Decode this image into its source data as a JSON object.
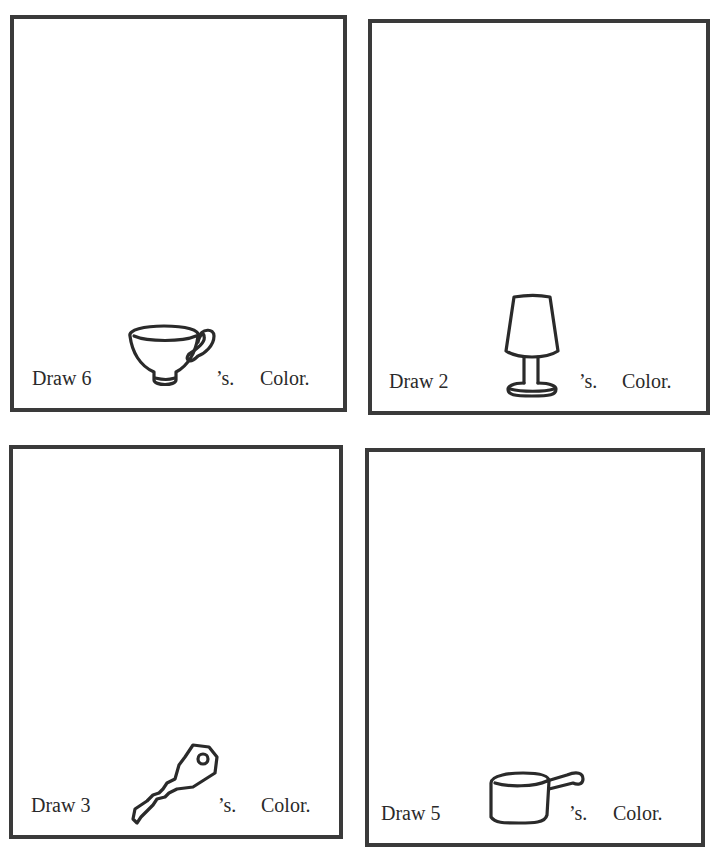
{
  "worksheet": {
    "panels": [
      {
        "id": "cups",
        "prefix": "Draw 6",
        "object": "cup",
        "icon": "teacup-icon",
        "suffix": "’s.",
        "action": "Color."
      },
      {
        "id": "lamps",
        "prefix": "Draw 2",
        "object": "lamp",
        "icon": "lamp-icon",
        "suffix": "’s.",
        "action": "Color."
      },
      {
        "id": "keys",
        "prefix": "Draw 3",
        "object": "key",
        "icon": "key-icon",
        "suffix": "’s.",
        "action": "Color."
      },
      {
        "id": "pots",
        "prefix": "Draw 5",
        "object": "pot",
        "icon": "saucepan-icon",
        "suffix": "’s.",
        "action": "Color."
      }
    ],
    "colors": {
      "border": "#3a3a3a",
      "text": "#2a2a2a",
      "background": "#ffffff"
    }
  }
}
